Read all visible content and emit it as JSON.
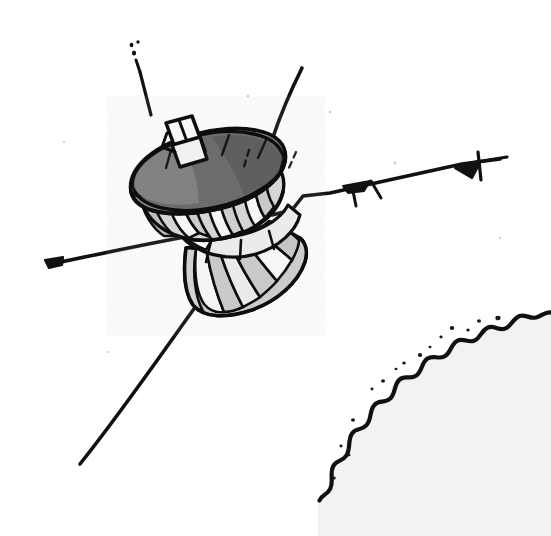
{
  "image": {
    "kind": "line-drawing",
    "subject": "spacecraft-over-planet-limb",
    "width": 551,
    "height": 536,
    "background_color": "#ffffff",
    "ink_color": "#111111",
    "technique": "black-and-white technical illustration, halftone shading"
  },
  "palette": {
    "background": "#ffffff",
    "ink": "#111111",
    "dish_interior_dark": "#6e6e6e",
    "dish_interior_mid": "#8c8c8c",
    "panel_gray": "#c9c9c9",
    "panel_light": "#e2e2e2",
    "panel_white": "#fbfbfb",
    "limb_interior": "#f2f2f2"
  },
  "spacecraft": {
    "name": "orbiter-spacecraft",
    "parts": [
      {
        "id": "high-gain-dish",
        "label": "High-gain dish antenna",
        "fill": "#6e6e6e"
      },
      {
        "id": "dish-rim",
        "label": "Dish rim ellipse",
        "fill": "#8c8c8c"
      },
      {
        "id": "equipment-box",
        "label": "Rim-mounted equipment box",
        "fill": "#fbfbfb"
      },
      {
        "id": "upper-drum",
        "label": "Upper faceted drum",
        "fill": "#d8d8d8"
      },
      {
        "id": "lower-skirt",
        "label": "Lower conical skirt with radial panels",
        "fill": "#cfcfcf"
      },
      {
        "id": "mid-band",
        "label": "Mid equipment band",
        "fill": "#eeeeee"
      }
    ],
    "booms": [
      {
        "id": "boom-upper-left",
        "label": "Upper-left antenna boom",
        "tip": "dashed-tip"
      },
      {
        "id": "boom-upper-right",
        "label": "Upper-right antenna boom",
        "tip": "plain"
      },
      {
        "id": "boom-lower-left",
        "label": "Lower-left long antenna boom",
        "tip": "plain"
      },
      {
        "id": "boom-left",
        "label": "Left horizontal boom",
        "tip": "end-cap"
      },
      {
        "id": "boom-magnetometer",
        "label": "Right magnetometer boom",
        "tip": "sensor-head"
      }
    ],
    "instruments": [
      {
        "id": "mag-sensor-inner",
        "label": "Inner magnetometer sensor"
      },
      {
        "id": "mag-sensor-outer",
        "label": "Outer magnetometer sensor"
      }
    ],
    "panel_count_skirt": 11,
    "panel_count_drum": 9
  },
  "planet": {
    "id": "planet-limb",
    "label": "Planet limb with scalloped cloud tops",
    "position": "lower-right",
    "interior_fill": "#f2f2f2",
    "scallop_count": 14
  },
  "speckles": {
    "label": "Scanned halftone speckles",
    "count": 12
  }
}
